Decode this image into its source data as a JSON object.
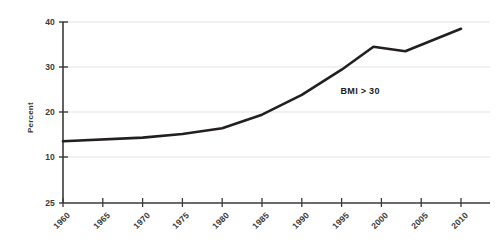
{
  "chart_data": {
    "type": "line",
    "title": "",
    "subtitle": "",
    "xlabel": "",
    "ylabel": "Percent",
    "xlim": [
      1960,
      2010
    ],
    "ylim": [
      10,
      40
    ],
    "grid": "horizontal",
    "legend_position": "none",
    "background_color": "#ffffff",
    "line_color": "#231f20",
    "grid_color": "#e3e3e3",
    "axis_color": "#3a3a3a",
    "x_ticks": [
      "1960",
      "1965",
      "1970",
      "1975",
      "1980",
      "1985",
      "1990",
      "1995",
      "2000",
      "2005",
      "2010"
    ],
    "y_ticks": [
      "40",
      "30",
      "20",
      "10",
      "25"
    ],
    "y_gridline_values": [
      "40",
      "30",
      "20",
      "10"
    ],
    "annotations": [
      {
        "text": "BMI > 30",
        "x": 1996,
        "y": 24.5
      }
    ],
    "series": [
      {
        "name": "BMI > 30",
        "x": [
          1960,
          1970,
          1975,
          1980,
          1985,
          1990,
          1995,
          1999,
          2003,
          2010
        ],
        "values": [
          13.5,
          14.3,
          15.1,
          16.4,
          19.4,
          23.8,
          29.4,
          34.5,
          33.5,
          38.5
        ]
      }
    ]
  }
}
